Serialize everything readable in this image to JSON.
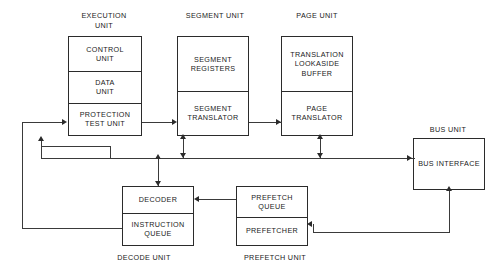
{
  "diagram": {
    "background_color": "#ffffff",
    "line_color": "#2b2b2b",
    "text_color": "#1a1a1a",
    "units": [
      {
        "id": "execution-unit",
        "label": "EXECUTION\nUNIT",
        "label_position": "top",
        "blocks": [
          {
            "id": "control-unit",
            "label": "CONTROL\nUNIT"
          },
          {
            "id": "data-unit",
            "label": "DATA\nUNIT"
          },
          {
            "id": "protection-test-unit",
            "label": "PROTECTION\nTEST UNIT"
          }
        ]
      },
      {
        "id": "segment-unit",
        "label": "SEGMENT UNIT",
        "label_position": "top",
        "blocks": [
          {
            "id": "segment-registers",
            "label": "SEGMENT\nREGISTERS"
          },
          {
            "id": "segment-translator",
            "label": "SEGMENT\nTRANSLATOR"
          }
        ]
      },
      {
        "id": "page-unit",
        "label": "PAGE UNIT",
        "label_position": "top",
        "blocks": [
          {
            "id": "translation-lookaside-buffer",
            "label": "TRANSLATION\nLOOKASIDE\nBUFFER"
          },
          {
            "id": "page-translator",
            "label": "PAGE\nTRANSLATOR"
          }
        ]
      },
      {
        "id": "bus-unit",
        "label": "BUS UNIT",
        "label_position": "top",
        "blocks": [
          {
            "id": "bus-interface",
            "label": "BUS INTERFACE"
          }
        ]
      },
      {
        "id": "decode-unit",
        "label": "DECODE UNIT",
        "label_position": "bottom",
        "blocks": [
          {
            "id": "decoder",
            "label": "DECODER"
          },
          {
            "id": "instruction-queue",
            "label": "INSTRUCTION\nQUEUE"
          }
        ]
      },
      {
        "id": "prefetch-unit",
        "label": "PREFETCH UNIT",
        "label_position": "bottom",
        "blocks": [
          {
            "id": "prefetch-queue",
            "label": "PREFETCH\nQUEUE"
          },
          {
            "id": "prefetcher",
            "label": "PREFETCHER"
          }
        ]
      }
    ],
    "connections": [
      {
        "id": "instruction-queue-to-protection-test-unit",
        "from": "instruction-queue",
        "to": "protection-test-unit",
        "direction": "one-way"
      },
      {
        "id": "protection-test-unit-to-segment-translator",
        "from": "protection-test-unit",
        "to": "segment-translator",
        "direction": "one-way"
      },
      {
        "id": "segment-translator-to-page-translator",
        "from": "segment-translator",
        "to": "page-translator",
        "direction": "one-way"
      },
      {
        "id": "bus-to-protection-test-unit",
        "from": "internal-bus",
        "to": "protection-test-unit",
        "direction": "one-way"
      },
      {
        "id": "bus-to-segment-translator",
        "from": "internal-bus",
        "to": "segment-translator",
        "direction": "two-way"
      },
      {
        "id": "bus-to-page-translator",
        "from": "internal-bus",
        "to": "page-translator",
        "direction": "two-way"
      },
      {
        "id": "bus-to-decoder",
        "from": "internal-bus",
        "to": "decoder",
        "direction": "two-way"
      },
      {
        "id": "bus-to-bus-interface",
        "from": "internal-bus",
        "to": "bus-interface",
        "direction": "one-way"
      },
      {
        "id": "prefetch-queue-to-decoder",
        "from": "prefetch-queue",
        "to": "decoder",
        "direction": "one-way"
      },
      {
        "id": "bus-interface-to-prefetcher",
        "from": "bus-interface",
        "to": "prefetcher",
        "direction": "one-way"
      }
    ]
  }
}
